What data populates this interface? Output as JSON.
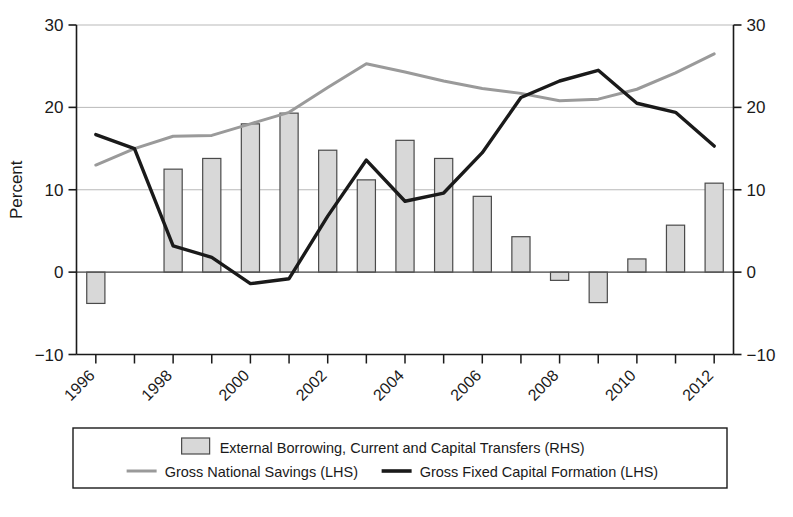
{
  "chart_data": {
    "type": "bar",
    "title": "",
    "subtitle": "",
    "xlabel": "",
    "ylabel": "Percent",
    "ylim": [
      -10,
      30
    ],
    "yticks": [
      -10,
      0,
      10,
      20,
      30
    ],
    "ytick_labels": [
      "−10",
      "0",
      "10",
      "20",
      "30"
    ],
    "right_ylim": [
      -10,
      30
    ],
    "right_yticks": [
      -10,
      0,
      10,
      20,
      30
    ],
    "right_ytick_labels": [
      "−10",
      "0",
      "10",
      "20",
      "30"
    ],
    "grid": true,
    "grid_axis": "y",
    "legend_position": "bottom",
    "x": [
      1996,
      1997,
      1998,
      1999,
      2000,
      2001,
      2002,
      2003,
      2004,
      2005,
      2006,
      2007,
      2008,
      2009,
      2010,
      2011,
      2012
    ],
    "xtick_labels": [
      "1996",
      "1998",
      "2000",
      "2002",
      "2004",
      "2006",
      "2008",
      "2010",
      "2012"
    ],
    "xtick_values": [
      1996,
      1998,
      2000,
      2002,
      2004,
      2006,
      2008,
      2010,
      2012
    ],
    "xlim": [
      1995.5,
      2012.5
    ],
    "series": [
      {
        "name": "External Borrowing, Current and Capital Transfers (RHS)",
        "type": "bar",
        "axis": "right",
        "color": "#d8d8d8",
        "edge_color": "#4a4a4a",
        "values": [
          -3.8,
          null,
          12.5,
          13.8,
          18.0,
          19.3,
          14.8,
          11.2,
          16.0,
          13.8,
          9.2,
          4.3,
          -1.0,
          -3.7,
          1.6,
          5.7,
          10.8
        ]
      },
      {
        "name": "Gross National Savings (LHS)",
        "type": "line",
        "axis": "left",
        "color": "#9a9a9a",
        "values": [
          13.0,
          15.0,
          16.5,
          16.6,
          18.0,
          19.4,
          22.4,
          25.3,
          24.3,
          23.2,
          22.3,
          21.7,
          20.8,
          21.0,
          22.2,
          24.2,
          26.5
        ]
      },
      {
        "name": "Gross Fixed Capital Formation (LHS)",
        "type": "line",
        "axis": "left",
        "color": "#1a1a1a",
        "values": [
          16.7,
          15.0,
          3.2,
          1.8,
          -1.4,
          -0.8,
          6.8,
          13.6,
          8.6,
          9.6,
          14.5,
          21.2,
          23.2,
          24.5,
          20.5,
          19.4,
          15.3
        ]
      }
    ],
    "legend_items": [
      {
        "label": "External Borrowing, Current and Capital Transfers (RHS)",
        "marker": "patch",
        "color": "#d8d8d8"
      },
      {
        "label": "Gross National Savings (LHS)",
        "marker": "line",
        "color": "#9a9a9a"
      },
      {
        "label": "Gross Fixed Capital Formation (LHS)",
        "marker": "line",
        "color": "#1a1a1a"
      }
    ]
  }
}
